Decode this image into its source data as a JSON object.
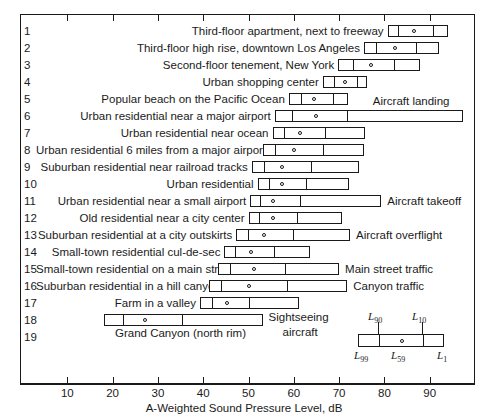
{
  "chart_data": {
    "type": "bar",
    "title": "",
    "xlabel": "A-Weighted Sound Pressure Level, dB",
    "ylabel": "",
    "xlim": [
      0,
      100
    ],
    "xticks": [
      10,
      20,
      30,
      40,
      50,
      60,
      70,
      80,
      90
    ],
    "xtick_labels": [
      "10",
      "20",
      "30",
      "40",
      "50",
      "60",
      "70",
      "80",
      "90"
    ],
    "grid": false,
    "legend_position": "inside-bottom-right",
    "note": "Each bar is a percentile box: left end = L99, first divider = L90, circle = L59, second divider = L10, right end = L1",
    "percentile_keys": [
      "L99",
      "L90",
      "L59",
      "L10",
      "L1"
    ],
    "series": [
      {
        "index": "1",
        "label": "Third-floor apartment, next to freeway",
        "source": "",
        "L99": 80.7,
        "L90": 82.7,
        "L59": 86.3,
        "L10": 90.4,
        "L1": 94.0
      },
      {
        "index": "2",
        "label": "Third-floor high rise, downtown Los Angeles",
        "source": "",
        "L99": 75.5,
        "L90": 78.0,
        "L59": 82.2,
        "L10": 86.7,
        "L1": 92.0
      },
      {
        "index": "3",
        "label": "Second-floor tenement, New York",
        "source": "",
        "L99": 69.8,
        "L90": 72.9,
        "L59": 76.9,
        "L10": 82.0,
        "L1": 87.8
      },
      {
        "index": "4",
        "label": "Urban shopping center",
        "source": "",
        "L99": 66.4,
        "L90": 68.7,
        "L59": 71.1,
        "L10": 73.8,
        "L1": 76.2
      },
      {
        "index": "5",
        "label": "Popular beach on the Pacific Ocean",
        "source": "",
        "L99": 58.9,
        "L90": 61.3,
        "L59": 64.2,
        "L10": 68.4,
        "L1": 72.0
      },
      {
        "index": "6",
        "label": "Urban residential near a major airport",
        "source": "Aircraft landing",
        "L99": 55.8,
        "L90": 59.3,
        "L59": 64.7,
        "L10": 71.6,
        "L1": 97.3
      },
      {
        "index": "7",
        "label": "Urban residential near ocean",
        "source": "",
        "L99": 55.3,
        "L90": 57.6,
        "L59": 61.1,
        "L10": 66.7,
        "L1": 75.8
      },
      {
        "index": "8",
        "label": "Urban residential 6 miles from a major airport",
        "source": "",
        "L99": 53.1,
        "L90": 55.6,
        "L59": 59.8,
        "L10": 66.2,
        "L1": 75.6
      },
      {
        "index": "9",
        "label": "Suburban residential near railroad tracks",
        "source": "",
        "L99": 50.7,
        "L90": 53.3,
        "L59": 57.1,
        "L10": 63.6,
        "L1": 74.4
      },
      {
        "index": "10",
        "label": "Urban residential",
        "source": "",
        "L99": 52.0,
        "L90": 54.2,
        "L59": 57.1,
        "L10": 62.4,
        "L1": 72.2
      },
      {
        "index": "11",
        "label": "Urban residential near a small airport",
        "source": "Aircraft takeoff",
        "L99": 50.4,
        "L90": 52.4,
        "L59": 55.3,
        "L10": 61.1,
        "L1": 79.3
      },
      {
        "index": "12",
        "label": "Old residential near a city center",
        "source": "",
        "L99": 50.0,
        "L90": 52.0,
        "L59": 55.1,
        "L10": 60.4,
        "L1": 70.7
      },
      {
        "index": "13",
        "label": "Suburban residential at a city outskirts",
        "source": "Aircraft overflight",
        "L99": 47.3,
        "L90": 49.6,
        "L59": 53.3,
        "L10": 59.6,
        "L1": 72.4
      },
      {
        "index": "14",
        "label": "Small-town residential cul-de-sec",
        "source": "",
        "L99": 44.7,
        "L90": 46.9,
        "L59": 50.4,
        "L10": 55.3,
        "L1": 63.6
      },
      {
        "index": "15",
        "label": "Small-town residential on a main street",
        "source": "Main street traffic",
        "L99": 43.3,
        "L90": 45.8,
        "L59": 50.9,
        "L10": 57.8,
        "L1": 70.0
      },
      {
        "index": "16",
        "label": "Suburban residential in a hill canyon",
        "source": "Canyon traffic",
        "L99": 41.3,
        "L90": 43.8,
        "L59": 49.8,
        "L10": 58.2,
        "L1": 71.8
      },
      {
        "index": "17",
        "label": "Farm in a valley",
        "source": "",
        "L99": 39.3,
        "L90": 41.8,
        "L59": 45.1,
        "L10": 50.0,
        "L1": 61.1
      },
      {
        "index": "18",
        "label": "Grand Canyon (north rim)",
        "source": "Sightseeing aircraft",
        "L99": 18.0,
        "L90": 22.0,
        "L59": 26.9,
        "L10": 35.1,
        "L1": 53.1
      }
    ]
  },
  "chart": {
    "row_numbers": [
      "1",
      "2",
      "3",
      "4",
      "5",
      "6",
      "7",
      "8",
      "9",
      "10",
      "11",
      "12",
      "13",
      "14",
      "15",
      "16",
      "17",
      "18",
      "19"
    ],
    "rows": [
      {
        "num": "1",
        "label": "Third-floor apartment, next to freeway",
        "source": ""
      },
      {
        "num": "2",
        "label": "Third-floor high rise, downtown Los Angeles",
        "source": ""
      },
      {
        "num": "3",
        "label": "Second-floor tenement, New York",
        "source": ""
      },
      {
        "num": "4",
        "label": "Urban shopping center",
        "source": ""
      },
      {
        "num": "5",
        "label": "Popular beach on the Pacific Ocean",
        "source": ""
      },
      {
        "num": "6",
        "label": "Urban residential near a major airport",
        "source": "Aircraft landing"
      },
      {
        "num": "7",
        "label": "Urban residential near ocean",
        "source": ""
      },
      {
        "num": "8",
        "label": "Urban residential 6 miles from a major airport",
        "source": ""
      },
      {
        "num": "9",
        "label": "Suburban residential near railroad tracks",
        "source": ""
      },
      {
        "num": "10",
        "label": "Urban residential",
        "source": ""
      },
      {
        "num": "11",
        "label": "Urban residential near a small airport",
        "source": "Aircraft takeoff"
      },
      {
        "num": "12",
        "label": "Old residential near a city center",
        "source": ""
      },
      {
        "num": "13",
        "label": "Suburban residential at a city outskirts",
        "source": "Aircraft overflight"
      },
      {
        "num": "14",
        "label": "Small-town residential cul-de-sec",
        "source": ""
      },
      {
        "num": "15",
        "label": "Small-town residential on a main street",
        "source": "Main street traffic"
      },
      {
        "num": "16",
        "label": "Suburban residential in a hill canyon",
        "source": "Canyon traffic"
      },
      {
        "num": "17",
        "label": "Farm in a valley",
        "source": ""
      },
      {
        "num": "18",
        "label": "Grand Canyon (north rim)",
        "source": "Sightseeing aircraft"
      }
    ],
    "legend": {
      "top_left": "L90",
      "top_right": "L10",
      "bottom_left": "L99",
      "bottom_mid": "L59",
      "bottom_right": "L1"
    },
    "axis_title": "A-Weighted Sound Pressure Level, dB"
  }
}
